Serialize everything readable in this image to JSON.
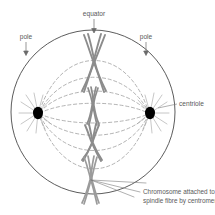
{
  "figure": {
    "type": "biology-cell-diagram",
    "background_color": "#ffffff",
    "cell": {
      "shape": "circle",
      "center_x": 93,
      "center_y": 112,
      "radius": 82,
      "stroke_color": "#4a4a4a",
      "stroke_width": 0.9,
      "fill": "none"
    }
  },
  "labels": {
    "equator": "equator",
    "pole_left": "pole",
    "pole_right": "pole",
    "centriole": "centriole",
    "caption_line1": "Chromosome attached to",
    "caption_line2": "spindle fibre by centromere."
  },
  "colors": {
    "outline": "#4a4a4a",
    "chromosome_stroke": "#8c8c8c",
    "chromosome_fill": "#ffffff",
    "spindle_dashed": "#9a9a9a",
    "centriole": "#000000",
    "aster": "#a0a0a0",
    "text": "#5a5a5a",
    "leader": "#7a7a7a"
  },
  "structures": {
    "centriole_left": {
      "cx": 38,
      "cy": 113,
      "rx": 5.0,
      "ry": 6.2,
      "color": "#000000"
    },
    "centriole_right": {
      "cx": 150,
      "cy": 113,
      "rx": 5.0,
      "ry": 6.2,
      "color": "#000000"
    },
    "chromosomes": [
      {
        "id": "chromosome-1",
        "cx": 94,
        "cy": 63,
        "half_height": 28,
        "spread_top": 11,
        "spread_bottom": 10,
        "label": "large X chromosome at equator top"
      },
      {
        "id": "chromosome-2",
        "cx": 93,
        "cy": 106,
        "half_height": 19,
        "spread_top": 6,
        "spread_bottom": 6,
        "label": "small X chromosome at equator centre"
      },
      {
        "id": "chromosome-3",
        "cx": 92,
        "cy": 143,
        "half_height": 18,
        "spread_top": 7,
        "spread_bottom": 7,
        "label": "medium X chromosome below equator"
      },
      {
        "id": "chromosome-4",
        "cx": 91,
        "cy": 180,
        "half_height": 24,
        "spread_top": 7,
        "spread_bottom": 9,
        "label": "elongated X chromosome at equator bottom"
      }
    ],
    "spindle_fibre_count": 8,
    "aster_ray_count": 9
  },
  "annotations": {
    "equator_arrow": {
      "from_x": 94,
      "from_y": 17,
      "to_x": 94,
      "to_y": 31,
      "direction": "down"
    },
    "pole_left_arrow": {
      "from_x": 26,
      "from_y": 40,
      "to_x": 26,
      "to_y": 53,
      "direction": "down"
    },
    "pole_right_arrow": {
      "from_x": 146,
      "from_y": 40,
      "to_x": 146,
      "to_y": 53,
      "direction": "down"
    },
    "centriole_leader": {
      "from_x": 160,
      "from_y": 107,
      "to_x": 178,
      "to_y": 104
    },
    "caption_leaders": 3
  },
  "text_sizes": {
    "label_px": 6.6,
    "caption_px": 6.4
  }
}
